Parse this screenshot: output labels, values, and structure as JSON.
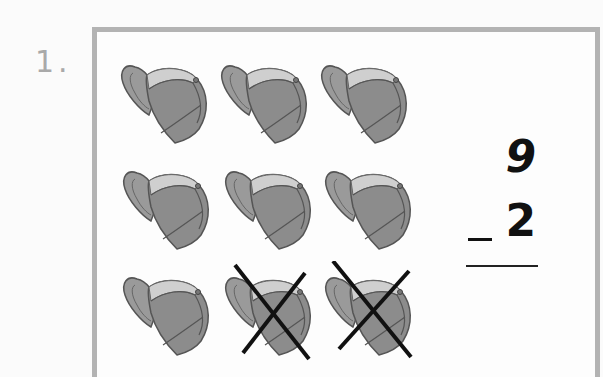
{
  "problem": {
    "number_label": "1.",
    "minuend": "9",
    "operator": "−",
    "subtrahend": "2",
    "answer": ""
  },
  "picture": {
    "object": "baseball cap",
    "total_count": 9,
    "crossed_out_count": 2,
    "rows": 3,
    "columns": 3,
    "caps": [
      {
        "row": 1,
        "col": 1,
        "crossed": false
      },
      {
        "row": 1,
        "col": 2,
        "crossed": false
      },
      {
        "row": 1,
        "col": 3,
        "crossed": false
      },
      {
        "row": 2,
        "col": 1,
        "crossed": false
      },
      {
        "row": 2,
        "col": 2,
        "crossed": false
      },
      {
        "row": 2,
        "col": 3,
        "crossed": false
      },
      {
        "row": 3,
        "col": 1,
        "crossed": false
      },
      {
        "row": 3,
        "col": 2,
        "crossed": true
      },
      {
        "row": 3,
        "col": 3,
        "crossed": true
      }
    ]
  },
  "colors": {
    "frame": "#b3b3b3",
    "cap_body": "#8a8a8a",
    "cap_band": "#c9c9c9",
    "cross": "#111111",
    "label": "#a9a9a9"
  }
}
